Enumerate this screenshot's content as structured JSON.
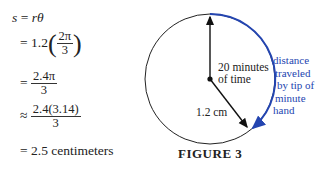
{
  "equation": {
    "line1": {
      "lhs": "s",
      "eq": "=",
      "rhs_r": "r",
      "rhs_theta": "θ"
    },
    "line2": {
      "op": "=",
      "coef": "1.2",
      "num": "2π",
      "den": "3"
    },
    "line3": {
      "op": "=",
      "num": "2.4π",
      "den": "3"
    },
    "line4": {
      "op": "≈",
      "num": "2.4(3.14)",
      "den": "3"
    },
    "line5": {
      "op": "=",
      "text": "2.5 centimeters"
    }
  },
  "figure": {
    "hand_label_line1": "20 minutes",
    "hand_label_line2": "of time",
    "radius_label": "1.2 cm",
    "arc_label_lines": [
      "distance",
      "traveled",
      "by tip of",
      "minute",
      "hand"
    ],
    "caption": "FIGURE 3",
    "colors": {
      "arc": "#2445b0",
      "circle": "#222222",
      "hands": "#111111"
    }
  }
}
